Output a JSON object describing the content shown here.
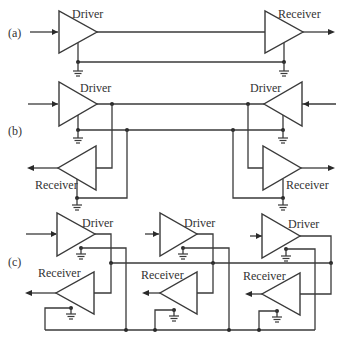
{
  "sections": {
    "a": {
      "label": "(a)",
      "driver": "Driver",
      "receiver": "Receiver"
    },
    "b": {
      "label": "(b)",
      "driver_left": "Driver",
      "driver_right": "Driver",
      "receiver_left": "Receiver",
      "receiver_right": "Receiver"
    },
    "c": {
      "label": "(c)",
      "drivers": [
        "Driver",
        "Driver",
        "Driver"
      ],
      "receivers": [
        "Receiver",
        "Receiver",
        "Receiver"
      ]
    }
  },
  "colors": {
    "line": "#3a3a3a",
    "background": "#ffffff"
  }
}
